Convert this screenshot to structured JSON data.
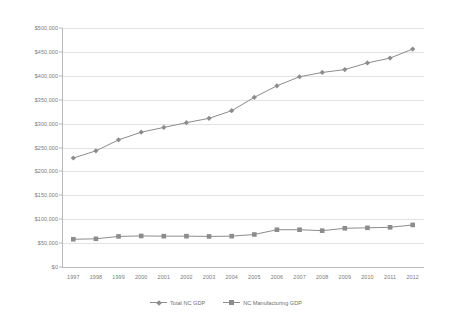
{
  "chart_data": {
    "type": "line",
    "title": "",
    "subtitle": "",
    "xlabel": "",
    "ylabel": "",
    "grid": true,
    "legend_position": "bottom",
    "ylim": [
      0,
      500000
    ],
    "ytick_step": 50000,
    "categories": [
      "1997",
      "1998",
      "1999",
      "2000",
      "2001",
      "2002",
      "2003",
      "2004",
      "2005",
      "2006",
      "2007",
      "2008",
      "2009",
      "2010",
      "2011",
      "2012"
    ],
    "ytick_labels": [
      "$0",
      "$50,000",
      "$100,000",
      "$150,000",
      "$200,000",
      "$250,000",
      "$300,000",
      "$350,000",
      "$400,000",
      "$450,000",
      "$500,000"
    ],
    "ytick_values": [
      0,
      50000,
      100000,
      150000,
      200000,
      250000,
      300000,
      350000,
      400000,
      450000,
      500000
    ],
    "series": [
      {
        "name": "Total NC GDP",
        "marker": "diamond",
        "color": "#8c8c8c",
        "values": [
          228000,
          243000,
          266000,
          282000,
          292000,
          302000,
          311000,
          327000,
          355000,
          379000,
          398000,
          407000,
          413000,
          427000,
          437000,
          456000
        ]
      },
      {
        "name": "NC Manufacturing GDP",
        "marker": "square",
        "color": "#8c8c8c",
        "values": [
          58000,
          59000,
          64000,
          65000,
          64500,
          64500,
          64000,
          64500,
          68000,
          78000,
          78000,
          76000,
          81000,
          82000,
          83000,
          88000
        ]
      }
    ]
  },
  "legend": {
    "entries": [
      {
        "label": "Total NC GDP"
      },
      {
        "label": "NC Manufacturing GDP"
      }
    ]
  },
  "colors": {
    "series_line": "#8c8c8c",
    "gridline": "#e2e2e2",
    "axis": "#b8b8b8",
    "tick_text": "#7a7a7a",
    "background": "#ffffff"
  }
}
